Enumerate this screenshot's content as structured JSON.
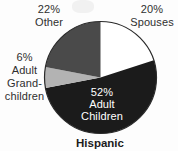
{
  "title": "Hispanic",
  "chart_data": {
    "type": "pie",
    "title": "Hispanic",
    "start_angle": "12 o'clock",
    "direction": "clockwise",
    "segments": [
      {
        "label": "Spouses",
        "value_pct": 20,
        "color": "#ffffff"
      },
      {
        "label": "Adult Children",
        "value_pct": 52,
        "color": "#1b1b1b"
      },
      {
        "label": "Adult Grandchildren",
        "value_pct": 6,
        "color": "#b3b3b3"
      },
      {
        "label": "Other",
        "value_pct": 22,
        "color": "#4a4a4a"
      }
    ],
    "outline_color": "#2a2a2a",
    "label_color_outside": "#2f2f2f",
    "label_color_inside": "#ffffff",
    "legend": "none",
    "labels_on_chart": true
  },
  "labels": {
    "other": {
      "pct": "22%",
      "name": "Other"
    },
    "spouses": {
      "pct": "20%",
      "name": "Spouses"
    },
    "grandchildren": {
      "pct": "6%",
      "line2": "Adult",
      "line3": "Grand-",
      "line4": "children"
    },
    "adult_children": {
      "pct": "52%",
      "line2": "Adult",
      "line3": "Children"
    }
  }
}
